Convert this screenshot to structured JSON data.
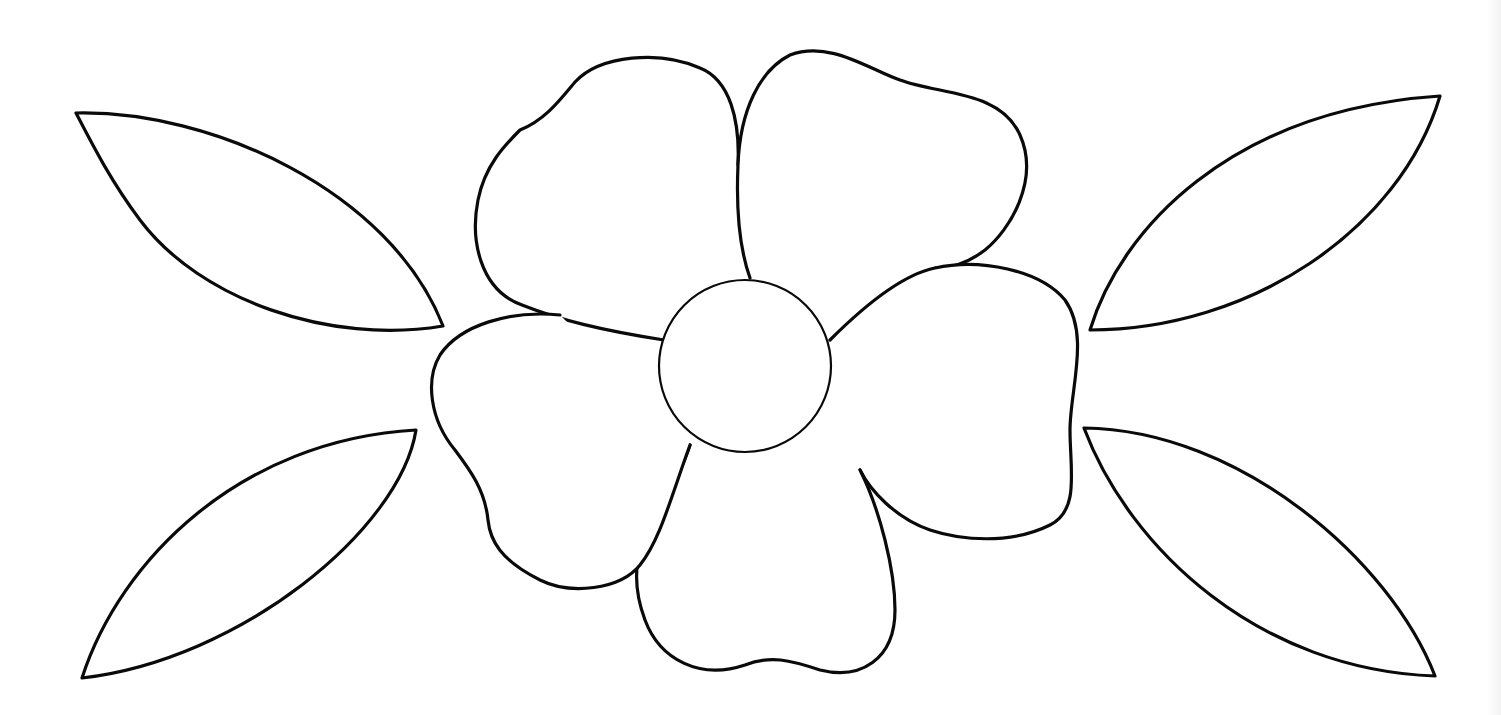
{
  "image": {
    "description": "Black outline line drawing of a five-petal flower with a round center, flanked by two pointed leaves on each side",
    "colors": {
      "line": "#0a0a0a",
      "background": "#ffffff"
    },
    "elements": {
      "flower": {
        "petal_count": 5,
        "center": "circle"
      },
      "leaves": [
        "upper-left",
        "lower-left",
        "upper-right",
        "lower-right"
      ]
    }
  }
}
